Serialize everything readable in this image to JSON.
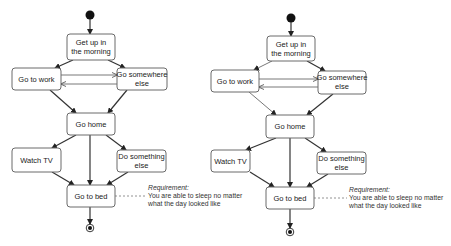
{
  "diagrams": [
    {
      "id": "left",
      "type": "uml-activity",
      "nodes": {
        "start": {
          "kind": "initial"
        },
        "get_up": {
          "label_lines": [
            "Get up in",
            "the morning"
          ]
        },
        "go_to_work": {
          "label_lines": [
            "Go to work"
          ]
        },
        "go_somewhere_else": {
          "label_lines": [
            "Go somewhere",
            "else"
          ]
        },
        "go_home": {
          "label_lines": [
            "Go home"
          ]
        },
        "watch_tv": {
          "label_lines": [
            "Watch TV"
          ]
        },
        "do_something_else": {
          "label_lines": [
            "Do something",
            "else"
          ]
        },
        "go_to_bed": {
          "label_lines": [
            "Go to bed"
          ]
        },
        "end": {
          "kind": "final"
        }
      },
      "edges": [
        [
          "start",
          "get_up"
        ],
        [
          "get_up",
          "go_to_work"
        ],
        [
          "get_up",
          "go_somewhere_else"
        ],
        [
          "go_to_work",
          "go_somewhere_else"
        ],
        [
          "go_somewhere_else",
          "go_to_work"
        ],
        [
          "go_to_work",
          "go_home"
        ],
        [
          "go_somewhere_else",
          "go_home"
        ],
        [
          "go_home",
          "watch_tv"
        ],
        [
          "go_home",
          "go_to_bed"
        ],
        [
          "go_home",
          "do_something_else"
        ],
        [
          "watch_tv",
          "go_to_bed"
        ],
        [
          "do_something_else",
          "go_to_bed"
        ],
        [
          "go_to_bed",
          "end"
        ]
      ],
      "note": {
        "title": "Requirement:",
        "lines": [
          "You are able to sleep no matter",
          "what the day looked like"
        ],
        "attached_to": "go_to_bed"
      }
    },
    {
      "id": "right",
      "type": "uml-activity",
      "nodes": {
        "start": {
          "kind": "initial"
        },
        "get_up": {
          "label_lines": [
            "Get up in",
            "the morning"
          ]
        },
        "go_to_work": {
          "label_lines": [
            "Go to work"
          ]
        },
        "go_somewhere_else": {
          "label_lines": [
            "Go somewhere",
            "else"
          ]
        },
        "go_home": {
          "label_lines": [
            "Go home"
          ]
        },
        "watch_tv": {
          "label_lines": [
            "Watch TV"
          ]
        },
        "do_something_else": {
          "label_lines": [
            "Do something",
            "else"
          ]
        },
        "go_to_bed": {
          "label_lines": [
            "Go to bed"
          ]
        },
        "end": {
          "kind": "final"
        }
      },
      "edges": [
        [
          "start",
          "get_up"
        ],
        [
          "get_up",
          "go_to_work"
        ],
        [
          "get_up",
          "go_somewhere_else"
        ],
        [
          "go_to_work",
          "go_somewhere_else"
        ],
        [
          "go_somewhere_else",
          "go_to_work"
        ],
        [
          "go_to_work",
          "go_home"
        ],
        [
          "go_somewhere_else",
          "go_home"
        ],
        [
          "go_home",
          "watch_tv"
        ],
        [
          "go_home",
          "go_to_bed"
        ],
        [
          "go_home",
          "do_something_else"
        ],
        [
          "watch_tv",
          "go_to_bed"
        ],
        [
          "do_something_else",
          "go_to_bed"
        ],
        [
          "go_to_bed",
          "end"
        ]
      ],
      "note": {
        "title": "Requirement:",
        "lines": [
          "You are able to sleep no matter",
          "what the day looked like"
        ],
        "attached_to": "go_to_bed"
      }
    }
  ],
  "colors": {
    "node_border": "#6a6a6a",
    "arrow": "#333333",
    "text": "#222222",
    "background": "#ffffff"
  }
}
